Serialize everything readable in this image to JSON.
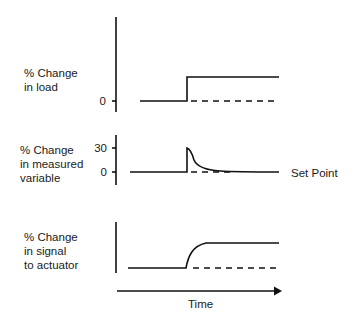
{
  "panels": [
    {
      "label_line1": "% Change",
      "label_line2": "in load",
      "label_line3": "",
      "ticks": [
        {
          "label": "0"
        }
      ],
      "description": "Step increase in load at disturbance time"
    },
    {
      "label_line1": "% Change",
      "label_line2": "in measured",
      "label_line3": "variable",
      "ticks": [
        {
          "label": "30"
        },
        {
          "label": "0"
        }
      ],
      "annotation": "Set Point",
      "description": "Spike to 30% then decays back to set point"
    },
    {
      "label_line1": "% Change",
      "label_line2": "in signal",
      "label_line3": "to actuator",
      "ticks": [],
      "description": "Signal rises smoothly to new steady level"
    }
  ],
  "x_axis": {
    "label": "Time"
  },
  "colors": {
    "line": "#111111",
    "background": "#ffffff"
  }
}
